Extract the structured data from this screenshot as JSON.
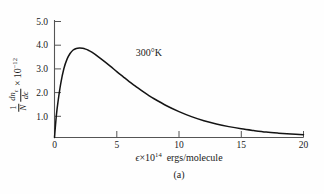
{
  "figure": {
    "caption": "(a)",
    "annotation": "300°K",
    "background_color": "#fefefe",
    "curve_color": "#141414",
    "axis_color": "#4a4a4a"
  },
  "axes": {
    "x": {
      "label_parts": {
        "variable": "ϵ",
        "times": "×",
        "base": "10",
        "exponent": "14",
        "units": "ergs/molecule"
      },
      "label_text": "ϵ×10¹⁴ ergs/molecule",
      "ticks": [
        "0",
        "5",
        "10",
        "15",
        "20"
      ],
      "tick_values": [
        0,
        5,
        10,
        15,
        20
      ],
      "min": 0,
      "max": 20
    },
    "y": {
      "label_parts": {
        "frac_outer_num": "1",
        "frac_outer_den": "N",
        "frac_inner_num": "dn",
        "frac_inner_num_sub": "ϵ",
        "frac_inner_den": "dϵ",
        "times": "×",
        "base": "10",
        "exponent": "−12"
      },
      "label_text": "(1/N)(dnϵ/dϵ) × 10⁻¹²",
      "ticks": [
        "1.0",
        "2.0",
        "3.0",
        "4.0",
        "5.0"
      ],
      "tick_values": [
        1.0,
        2.0,
        3.0,
        4.0,
        5.0
      ],
      "min": 0,
      "max": 5.4
    }
  },
  "chart_data": {
    "type": "line",
    "title": "",
    "subtitle": "",
    "xlabel": "ϵ×10¹⁴ ergs/molecule",
    "ylabel": "(1/N)(dnϵ/dϵ) × 10⁻¹²",
    "xlim": [
      0,
      20
    ],
    "ylim": [
      0,
      5.4
    ],
    "grid": false,
    "legend": null,
    "annotations": [
      {
        "text": "300°K",
        "x": 7.0,
        "y": 3.05
      }
    ],
    "series": [
      {
        "name": "300°K Maxwell-Boltzmann energy distribution",
        "x": [
          0.0,
          0.15,
          0.3,
          0.5,
          0.75,
          1.0,
          1.25,
          1.5,
          1.75,
          2.0,
          2.25,
          2.5,
          2.75,
          3.0,
          3.5,
          4.0,
          4.5,
          5.0,
          5.5,
          6.0,
          6.5,
          7.0,
          7.5,
          8.0,
          9.0,
          10.0,
          11.0,
          12.0,
          13.0,
          14.0,
          15.0,
          16.0,
          17.0,
          18.0,
          19.0,
          20.0
        ],
        "y": [
          0.0,
          1.02,
          1.72,
          2.48,
          3.16,
          3.59,
          3.86,
          4.02,
          4.09,
          4.11,
          4.1,
          4.06,
          4.0,
          3.92,
          3.72,
          3.5,
          3.27,
          3.03,
          2.8,
          2.57,
          2.36,
          2.15,
          1.96,
          1.78,
          1.46,
          1.19,
          0.96,
          0.77,
          0.62,
          0.5,
          0.4,
          0.32,
          0.25,
          0.2,
          0.16,
          0.13
        ],
        "peak": {
          "x": 2.1,
          "y": 4.11
        }
      }
    ]
  }
}
